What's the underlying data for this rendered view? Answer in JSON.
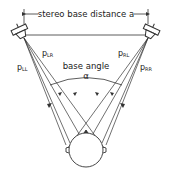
{
  "diagram": {
    "dimension_label": "stereo base distance a",
    "angle_label_top": "base angle",
    "angle_symbol": "α",
    "paths": {
      "left_to_left": "p",
      "left_to_left_sub": "LL",
      "left_to_right": "p",
      "left_to_right_sub": "LR",
      "right_to_left": "p",
      "right_to_left_sub": "RL",
      "right_to_right": "p",
      "right_to_right_sub": "RR"
    },
    "colors": {
      "line": "#333333",
      "background": "#ffffff"
    }
  }
}
